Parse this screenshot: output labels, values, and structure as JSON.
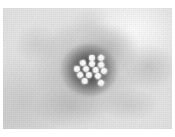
{
  "figure": {
    "kind": "electron-micrograph",
    "technique": "negative stain transmission electron microscopy",
    "caption": "",
    "width_px": 175,
    "height_px": 137
  },
  "colors": {
    "page_background": "#ffffff",
    "plate_background": "#e3e3e3",
    "plate_light_area": "#f4f4f4",
    "plate_mid_gray": "#cfcfcf",
    "stain_halo_dark": "#3a3a3a",
    "particle_bright": "#ffffff",
    "particle_edge": "#b3b3b3"
  },
  "plate": {
    "left": 3,
    "top": 8,
    "width": 169,
    "height": 121,
    "margin_top_px": 8,
    "margin_left_px": 3,
    "margin_right_px": 3,
    "margin_bottom_px": 8
  },
  "halo": {
    "center_x": 89,
    "center_y": 70,
    "width": 56,
    "height": 52,
    "outer_width": 104,
    "outer_height": 92,
    "outer_center_x": 88,
    "outer_center_y": 70
  },
  "particles": {
    "count": 14,
    "diameter_px": 6,
    "items": [
      {
        "cx": 92,
        "cy": 58,
        "d": 6.0
      },
      {
        "cx": 101,
        "cy": 58,
        "d": 6.2
      },
      {
        "cx": 83,
        "cy": 63,
        "d": 5.8
      },
      {
        "cx": 92,
        "cy": 64,
        "d": 6.0
      },
      {
        "cx": 101,
        "cy": 65,
        "d": 6.2
      },
      {
        "cx": 77,
        "cy": 69,
        "d": 5.8
      },
      {
        "cx": 86,
        "cy": 69,
        "d": 6.0
      },
      {
        "cx": 96,
        "cy": 70,
        "d": 5.6
      },
      {
        "cx": 104,
        "cy": 71,
        "d": 6.0
      },
      {
        "cx": 80,
        "cy": 75,
        "d": 6.2
      },
      {
        "cx": 89,
        "cy": 75,
        "d": 6.0
      },
      {
        "cx": 98,
        "cy": 76,
        "d": 5.8
      },
      {
        "cx": 85,
        "cy": 81,
        "d": 5.6
      },
      {
        "cx": 101,
        "cy": 83,
        "d": 6.0
      }
    ]
  }
}
